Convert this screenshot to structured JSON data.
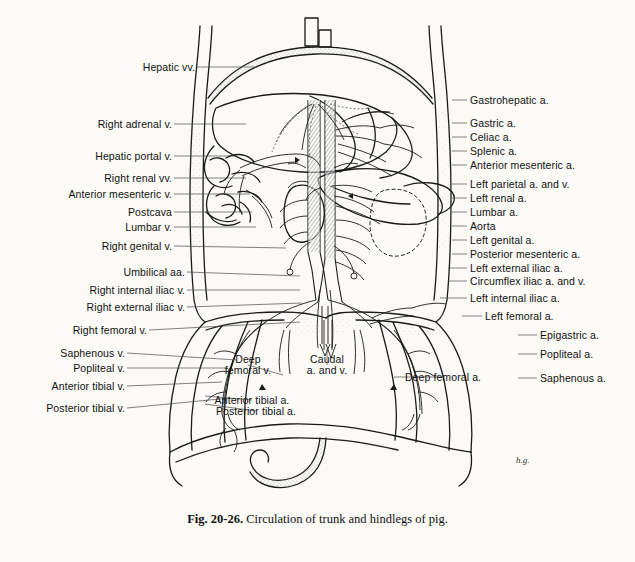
{
  "figure": {
    "caption_number": "Fig. 20-26.",
    "caption_text": " Circulation of trunk and hindlegs of pig.",
    "signature": "h.g.",
    "background_color": "#fbfaf6",
    "ink_color": "#1a1a1a",
    "leader_color": "#4a4a4a"
  },
  "labels_left": [
    {
      "text": "Hepatic vv.",
      "x": 195,
      "y": 67,
      "lx": 256,
      "ly": 67
    },
    {
      "text": "Right adrenal v.",
      "x": 172,
      "y": 124,
      "lx": 246,
      "ly": 124
    },
    {
      "text": "Hepatic portal v.",
      "x": 172,
      "y": 156,
      "lx": 236,
      "ly": 156
    },
    {
      "text": "Right renal vv.",
      "x": 172,
      "y": 178,
      "lx": 246,
      "ly": 178
    },
    {
      "text": "Anterior mesenteric v.",
      "x": 172,
      "y": 194,
      "lx": 250,
      "ly": 194
    },
    {
      "text": "Postcava",
      "x": 172,
      "y": 212,
      "lx": 252,
      "ly": 212
    },
    {
      "text": "Lumbar v.",
      "x": 172,
      "y": 227,
      "lx": 256,
      "ly": 227
    },
    {
      "text": "Right genital v.",
      "x": 172,
      "y": 246,
      "lx": 286,
      "ly": 248
    },
    {
      "text": "Umbilical aa.",
      "x": 185,
      "y": 272,
      "lx": 300,
      "ly": 276
    },
    {
      "text": "Right internal iliac v.",
      "x": 185,
      "y": 290,
      "lx": 300,
      "ly": 290
    },
    {
      "text": "Right external iliac v.",
      "x": 185,
      "y": 307,
      "lx": 302,
      "ly": 303
    },
    {
      "text": "Right femoral v.",
      "x": 147,
      "y": 330,
      "lx": 300,
      "ly": 322
    },
    {
      "text": "Saphenous v.",
      "x": 125,
      "y": 353,
      "lx": 237,
      "ly": 360
    },
    {
      "text": "Popliteal v.",
      "x": 125,
      "y": 368,
      "lx": 228,
      "ly": 368
    },
    {
      "text": "Anterior tibial v.",
      "x": 125,
      "y": 386,
      "lx": 222,
      "ly": 382
    },
    {
      "text": "Posterior tibial v.",
      "x": 125,
      "y": 408,
      "lx": 230,
      "ly": 398
    }
  ],
  "labels_right": [
    {
      "text": "Gastrohepatic a.",
      "x": 470,
      "y": 100,
      "lx": 452,
      "ly": 100
    },
    {
      "text": "Gastric a.",
      "x": 470,
      "y": 123,
      "lx": 452,
      "ly": 123
    },
    {
      "text": "Celiac a.",
      "x": 470,
      "y": 137,
      "lx": 452,
      "ly": 137
    },
    {
      "text": "Splenic a.",
      "x": 470,
      "y": 151,
      "lx": 452,
      "ly": 151
    },
    {
      "text": "Anterior mesenteric a.",
      "x": 470,
      "y": 165,
      "lx": 452,
      "ly": 165
    },
    {
      "text": "Left parietal a. and v.",
      "x": 470,
      "y": 184,
      "lx": 452,
      "ly": 184
    },
    {
      "text": "Left renal a.",
      "x": 470,
      "y": 198,
      "lx": 452,
      "ly": 198
    },
    {
      "text": "Lumbar a.",
      "x": 470,
      "y": 212,
      "lx": 452,
      "ly": 212
    },
    {
      "text": "Aorta",
      "x": 470,
      "y": 226,
      "lx": 452,
      "ly": 226
    },
    {
      "text": "Left genital a.",
      "x": 470,
      "y": 240,
      "lx": 452,
      "ly": 240
    },
    {
      "text": "Posterior mesenteric a.",
      "x": 470,
      "y": 254,
      "lx": 452,
      "ly": 254
    },
    {
      "text": "Left external iliac a.",
      "x": 470,
      "y": 268,
      "lx": 448,
      "ly": 268
    },
    {
      "text": "Circumflex iliac a. and v.",
      "x": 470,
      "y": 281,
      "lx": 448,
      "ly": 281
    },
    {
      "text": "Left internal iliac a.",
      "x": 470,
      "y": 298,
      "lx": 440,
      "ly": 298
    },
    {
      "text": "Left femoral a.",
      "x": 485,
      "y": 316,
      "lx": 462,
      "ly": 316
    },
    {
      "text": "Epigastric a.",
      "x": 540,
      "y": 335,
      "lx": 518,
      "ly": 335
    },
    {
      "text": "Popliteal a.",
      "x": 540,
      "y": 354,
      "lx": 518,
      "ly": 354
    },
    {
      "text": "Saphenous a.",
      "x": 540,
      "y": 378,
      "lx": 518,
      "ly": 378
    }
  ],
  "labels_center": [
    {
      "line1": "Deep",
      "line2": "femoral v.",
      "x": 248,
      "y": 365,
      "lx": 283,
      "ly": 375
    },
    {
      "line1": "Caudal",
      "line2": "a. and v.",
      "x": 327,
      "y": 365,
      "lx": 327,
      "ly": 349
    },
    {
      "line1": "Deep femoral a.",
      "line2": "",
      "x": 443,
      "y": 377,
      "lx": 394,
      "ly": 377
    },
    {
      "line1": "Anterior tibial a.",
      "line2": "",
      "x": 252,
      "y": 400,
      "lx": 205,
      "ly": 396
    },
    {
      "line1": "Posterior tibial a.",
      "line2": "",
      "x": 256,
      "y": 411,
      "lx": 205,
      "ly": 404
    }
  ]
}
